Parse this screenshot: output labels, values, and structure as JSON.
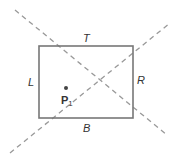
{
  "diagram": {
    "edge_labels": {
      "top": "T",
      "bottom": "B",
      "left": "L",
      "right": "R"
    },
    "point_label": "P",
    "point_subscript": "1",
    "colors": {
      "rect_stroke": "#777777",
      "dash_stroke": "#999999",
      "text": "#333333"
    }
  }
}
